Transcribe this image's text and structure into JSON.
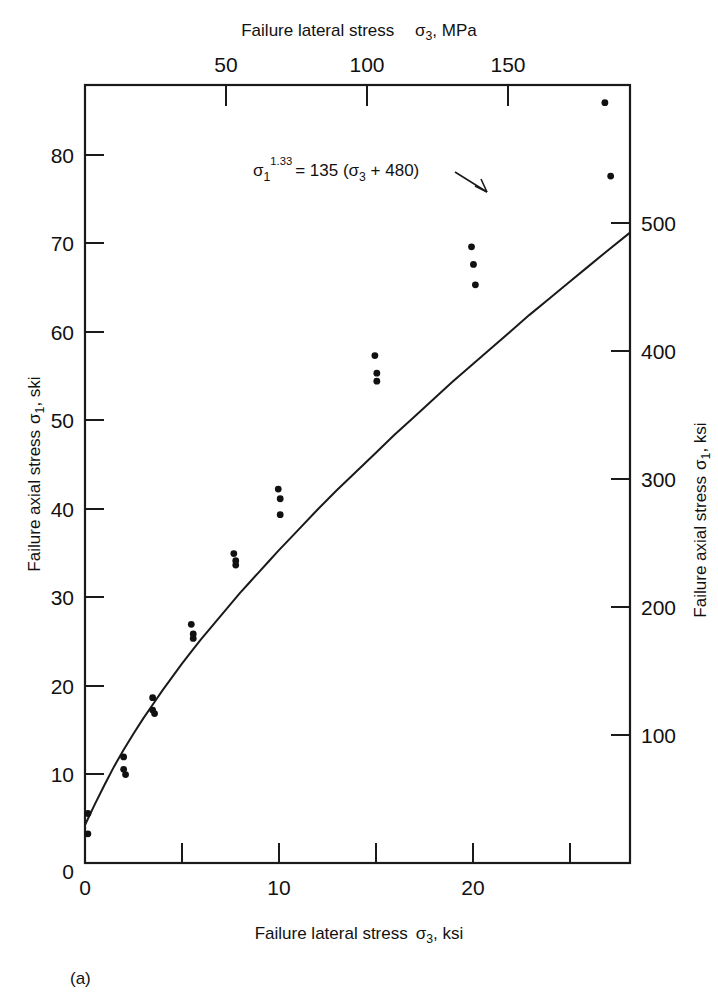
{
  "figure": {
    "panel_label": "(a)"
  },
  "chart_data": {
    "type": "scatter",
    "title": "",
    "xlabel": "Failure lateral stress σ₃, ksi",
    "ylabel": "Failure axial stress σ₁, ski",
    "xlabel_top": "Failure lateral stress   σ₃, MPa",
    "ylabel_right": "Failure axial stress σ₁, ksi",
    "xlim": [
      0,
      28.2
    ],
    "ylim": [
      0,
      88
    ],
    "xlim_top_mpa": [
      0,
      194.4
    ],
    "ylim_right_mpa": [
      0,
      606.8
    ],
    "grid": false,
    "legend": null,
    "xticks": [
      0,
      10,
      20
    ],
    "xticklabels": [
      "0",
      "10",
      "20"
    ],
    "xminorticks": [
      5,
      15,
      25
    ],
    "yticks": [
      0,
      10,
      20,
      30,
      40,
      50,
      60,
      70,
      80
    ],
    "yticklabels": [
      "0",
      "10",
      "20",
      "30",
      "40",
      "50",
      "60",
      "70",
      "80"
    ],
    "xticks_top_mpa": [
      50,
      100,
      150
    ],
    "xticklabels_top": [
      "50",
      "100",
      "150"
    ],
    "yticks_right_mpa": [
      100,
      200,
      300,
      400,
      500
    ],
    "yticklabels_right": [
      "100",
      "200",
      "300",
      "400",
      "500"
    ],
    "annotation": {
      "text": "σ₁^1.33 = 135 (σ₃ + 480)",
      "parts": {
        "sigma1": "σ",
        "exponent": "1.33",
        "base_sub": "1",
        "equals": "= 135 (",
        "sigma3": "σ",
        "sigma3_sub": "3",
        "tail": " + 480)"
      }
    },
    "series": [
      {
        "name": "Failure data",
        "marker": "dot",
        "points": [
          [
            0.15,
            5.6
          ],
          [
            0.15,
            3.3
          ],
          [
            2.0,
            12.0
          ],
          [
            2.0,
            10.6
          ],
          [
            2.1,
            10.0
          ],
          [
            3.5,
            18.7
          ],
          [
            3.5,
            17.3
          ],
          [
            3.6,
            16.9
          ],
          [
            5.5,
            27.0
          ],
          [
            5.6,
            25.9
          ],
          [
            5.6,
            25.4
          ],
          [
            7.7,
            35.0
          ],
          [
            7.8,
            34.2
          ],
          [
            7.8,
            33.7
          ],
          [
            10.0,
            42.3
          ],
          [
            10.1,
            41.2
          ],
          [
            10.1,
            39.4
          ],
          [
            15.0,
            57.4
          ],
          [
            15.1,
            55.4
          ],
          [
            15.1,
            54.5
          ],
          [
            20.0,
            69.7
          ],
          [
            20.1,
            67.7
          ],
          [
            20.2,
            65.4
          ],
          [
            26.9,
            86.0
          ],
          [
            27.2,
            77.7
          ]
        ]
      }
    ],
    "fit_curve": {
      "name": "Fitted failure envelope",
      "equation": "σ₁^1.33 = 135 (σ₃ + 480)",
      "points": [
        [
          0.0,
          4.3
        ],
        [
          0.5,
          6.6
        ],
        [
          1.0,
          8.8
        ],
        [
          1.5,
          10.9
        ],
        [
          2.0,
          12.8
        ],
        [
          2.5,
          14.6
        ],
        [
          3.0,
          16.3
        ],
        [
          3.5,
          17.9
        ],
        [
          4.0,
          19.5
        ],
        [
          4.5,
          21.0
        ],
        [
          5.0,
          22.5
        ],
        [
          5.5,
          23.9
        ],
        [
          6.0,
          25.3
        ],
        [
          6.5,
          26.6
        ],
        [
          7.0,
          27.9
        ],
        [
          7.5,
          29.2
        ],
        [
          8.0,
          30.5
        ],
        [
          8.5,
          31.7
        ],
        [
          9.0,
          32.9
        ],
        [
          9.5,
          34.1
        ],
        [
          10.0,
          35.3
        ],
        [
          11.0,
          37.6
        ],
        [
          12.0,
          39.9
        ],
        [
          13.0,
          42.1
        ],
        [
          14.0,
          44.2
        ],
        [
          15.0,
          46.3
        ],
        [
          16.0,
          48.4
        ],
        [
          17.0,
          50.4
        ],
        [
          18.0,
          52.4
        ],
        [
          19.0,
          54.4
        ],
        [
          20.0,
          56.3
        ],
        [
          21.0,
          58.2
        ],
        [
          22.0,
          60.1
        ],
        [
          23.0,
          62.0
        ],
        [
          24.0,
          63.8
        ],
        [
          25.0,
          65.6
        ],
        [
          26.0,
          67.4
        ],
        [
          27.0,
          69.2
        ],
        [
          28.2,
          71.3
        ]
      ]
    }
  }
}
